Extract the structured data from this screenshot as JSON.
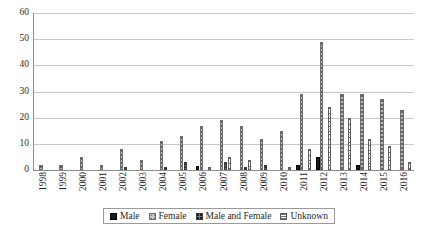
{
  "chart_data": {
    "type": "bar",
    "title": "",
    "subtitle": "",
    "xlabel": "",
    "ylabel": "",
    "ylim": [
      0,
      60
    ],
    "y_ticks": [
      0,
      10,
      20,
      30,
      40,
      50,
      60
    ],
    "grid": true,
    "legend_position": "bottom",
    "categories": [
      "1998",
      "1999",
      "2000",
      "2001",
      "2002",
      "2003",
      "2004",
      "2005",
      "2006",
      "2007",
      "2008",
      "2009",
      "2010",
      "2011",
      "2012",
      "2013",
      "2014",
      "2015",
      "2016"
    ],
    "series": [
      {
        "name": "Male",
        "color": "#1a1a1a",
        "values": [
          0,
          0,
          0,
          0,
          0,
          0,
          0,
          0,
          1.5,
          0,
          0,
          0,
          0,
          2,
          5,
          0,
          2,
          0,
          0
        ]
      },
      {
        "name": "Female",
        "color": "#b8b8b8",
        "values": [
          2,
          2,
          5,
          2,
          8,
          4,
          11,
          13,
          17,
          19,
          17,
          12,
          15,
          29,
          49,
          29,
          29,
          27,
          23
        ]
      },
      {
        "name": "Male and Female",
        "color": "#8a8a8a",
        "values": [
          0,
          0,
          0,
          0,
          1,
          0,
          1,
          3,
          0,
          3,
          1,
          2,
          0,
          0,
          0,
          0,
          0,
          0,
          0
        ]
      },
      {
        "name": "Unknown",
        "color": "#ffffff",
        "values": [
          0,
          0,
          0,
          0,
          0,
          0,
          0,
          0,
          1,
          5,
          4,
          0,
          1,
          8,
          24,
          20,
          12,
          9,
          3
        ]
      }
    ]
  },
  "legend": {
    "items": [
      {
        "label": "Male",
        "key": "male"
      },
      {
        "label": "Female",
        "key": "female"
      },
      {
        "label": "Male and Female",
        "key": "mf"
      },
      {
        "label": "Unknown",
        "key": "unknown"
      }
    ]
  }
}
